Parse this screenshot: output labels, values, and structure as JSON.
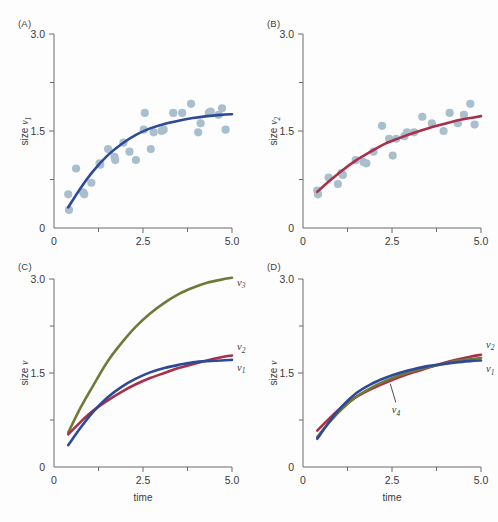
{
  "figure": {
    "background": "#fdfdfd",
    "panels": [
      "A",
      "B",
      "C",
      "D"
    ]
  },
  "colors": {
    "curve_v1": "#2d4a98",
    "curve_v2": "#a8304a",
    "curve_v3": "#6f7a38",
    "curve_v4": "#6f7a38",
    "scatter": "#a9bfcd",
    "axis": "#6b6b6b",
    "text": "#3a3a3a"
  },
  "axes": {
    "x_label": "time",
    "x_ticks": [
      "0",
      "2.5",
      "5.0"
    ],
    "x_tick_values": [
      0,
      2.5,
      5.0
    ],
    "x_minor_values": [
      1.25,
      3.75
    ],
    "x_min": 0,
    "x_max": 5.0,
    "y_ticks": [
      "0",
      "1.5",
      "3.0"
    ],
    "y_tick_values": [
      0,
      1.5,
      3.0
    ],
    "y_minor_values": [
      0.75,
      2.25
    ],
    "y_min": 0,
    "y_max": 3.0
  },
  "panel_A": {
    "label": "(A)",
    "y_label_prefix": "size ",
    "y_label_symbol": "ν",
    "y_label_sub": "1",
    "show_x_title": false
  },
  "panel_B": {
    "label": "(B)",
    "y_label_prefix": "size ",
    "y_label_symbol": "ν",
    "y_label_sub": "2",
    "show_x_title": false
  },
  "panel_C": {
    "label": "(C)",
    "y_label_prefix": "size ",
    "y_label_symbol": "ν",
    "y_label_sub": "",
    "show_x_title": true,
    "curve_labels": [
      {
        "symbol": "ν",
        "sub": "3"
      },
      {
        "symbol": "ν",
        "sub": "2"
      },
      {
        "symbol": "ν",
        "sub": "1"
      }
    ]
  },
  "panel_D": {
    "label": "(D)",
    "y_label_prefix": "size ",
    "y_label_symbol": "ν",
    "y_label_sub": "",
    "show_x_title": true,
    "curve_labels": [
      {
        "symbol": "ν",
        "sub": "2"
      },
      {
        "symbol": "ν",
        "sub": "1"
      },
      {
        "symbol": "ν",
        "sub": "4"
      }
    ]
  },
  "chart_data": [
    {
      "type": "scatter",
      "panel": "A",
      "title": "(A)",
      "xlabel": "time",
      "ylabel": "size ν1",
      "xlim": [
        0,
        5.0
      ],
      "ylim": [
        0,
        3.0
      ],
      "grid": false,
      "legend": "none",
      "series": [
        {
          "name": "data points",
          "kind": "scatter",
          "color": "#a9bfcd",
          "x": [
            0.4,
            0.42,
            0.62,
            0.82,
            0.85,
            1.05,
            1.28,
            1.3,
            1.52,
            1.7,
            1.72,
            1.95,
            2.12,
            2.3,
            2.52,
            2.55,
            2.72,
            2.8,
            3.02,
            3.08,
            3.35,
            3.6,
            3.85,
            4.05,
            4.12,
            4.35,
            4.4,
            4.62,
            4.72,
            4.82
          ],
          "y": [
            0.52,
            0.28,
            0.92,
            0.55,
            0.52,
            0.7,
            1.0,
            0.98,
            1.22,
            1.1,
            1.05,
            1.32,
            1.18,
            1.05,
            1.52,
            1.78,
            1.22,
            1.48,
            1.5,
            1.52,
            1.78,
            1.78,
            1.92,
            1.48,
            1.62,
            1.78,
            1.8,
            1.75,
            1.85,
            1.52
          ]
        },
        {
          "name": "ν1 fit",
          "kind": "line",
          "color": "#2d4a98",
          "x": [
            0.4,
            0.75,
            1.1,
            1.5,
            1.9,
            2.3,
            2.7,
            3.1,
            3.5,
            3.9,
            4.3,
            4.7,
            5.0
          ],
          "y": [
            0.32,
            0.62,
            0.88,
            1.12,
            1.3,
            1.44,
            1.54,
            1.61,
            1.66,
            1.7,
            1.73,
            1.75,
            1.76
          ]
        }
      ]
    },
    {
      "type": "scatter",
      "panel": "B",
      "title": "(B)",
      "xlabel": "time",
      "ylabel": "size ν2",
      "xlim": [
        0,
        5.0
      ],
      "ylim": [
        0,
        3.0
      ],
      "grid": false,
      "legend": "none",
      "series": [
        {
          "name": "data points",
          "kind": "scatter",
          "color": "#a9bfcd",
          "x": [
            0.4,
            0.42,
            0.72,
            0.98,
            1.08,
            1.12,
            1.48,
            1.7,
            1.78,
            1.98,
            2.22,
            2.42,
            2.52,
            2.62,
            2.85,
            2.92,
            3.12,
            3.35,
            3.62,
            3.95,
            4.12,
            4.35,
            4.52,
            4.7,
            4.82
          ],
          "y": [
            0.58,
            0.52,
            0.78,
            0.68,
            0.85,
            0.82,
            1.05,
            1.02,
            1.0,
            1.18,
            1.58,
            1.38,
            1.12,
            1.38,
            1.42,
            1.48,
            1.48,
            1.72,
            1.62,
            1.5,
            1.78,
            1.62,
            1.75,
            1.92,
            1.6
          ]
        },
        {
          "name": "ν2 fit",
          "kind": "line",
          "color": "#a8304a",
          "x": [
            0.4,
            0.75,
            1.1,
            1.5,
            1.9,
            2.3,
            2.7,
            3.1,
            3.5,
            3.9,
            4.3,
            4.7,
            5.0
          ],
          "y": [
            0.56,
            0.73,
            0.89,
            1.05,
            1.18,
            1.3,
            1.39,
            1.47,
            1.54,
            1.6,
            1.66,
            1.7,
            1.73
          ]
        }
      ]
    },
    {
      "type": "line",
      "panel": "C",
      "title": "(C)",
      "xlabel": "time",
      "ylabel": "size ν",
      "xlim": [
        0,
        5.0
      ],
      "ylim": [
        0,
        3.0
      ],
      "grid": false,
      "legend": "inline-right",
      "series": [
        {
          "name": "ν3",
          "kind": "line",
          "color": "#6f7a38",
          "x": [
            0.4,
            0.75,
            1.1,
            1.5,
            1.9,
            2.3,
            2.7,
            3.1,
            3.5,
            3.9,
            4.3,
            4.7,
            5.0
          ],
          "y": [
            0.55,
            0.95,
            1.3,
            1.68,
            1.98,
            2.24,
            2.45,
            2.62,
            2.76,
            2.86,
            2.94,
            2.99,
            3.02
          ]
        },
        {
          "name": "ν2",
          "kind": "line",
          "color": "#a8304a",
          "x": [
            0.4,
            0.75,
            1.1,
            1.5,
            1.9,
            2.3,
            2.7,
            3.1,
            3.5,
            3.9,
            4.3,
            4.7,
            5.0
          ],
          "y": [
            0.52,
            0.72,
            0.9,
            1.06,
            1.2,
            1.32,
            1.42,
            1.5,
            1.58,
            1.64,
            1.7,
            1.75,
            1.78
          ]
        },
        {
          "name": "ν1",
          "kind": "line",
          "color": "#2d4a98",
          "x": [
            0.4,
            0.75,
            1.1,
            1.5,
            1.9,
            2.3,
            2.7,
            3.1,
            3.5,
            3.9,
            4.3,
            4.7,
            5.0
          ],
          "y": [
            0.35,
            0.63,
            0.88,
            1.11,
            1.28,
            1.41,
            1.51,
            1.58,
            1.63,
            1.67,
            1.69,
            1.7,
            1.71
          ]
        }
      ]
    },
    {
      "type": "line",
      "panel": "D",
      "title": "(D)",
      "xlabel": "time",
      "ylabel": "size ν",
      "xlim": [
        0,
        5.0
      ],
      "ylim": [
        0,
        3.0
      ],
      "grid": false,
      "legend": "inline-right",
      "annotations": [
        {
          "text": "ν4",
          "x": 2.55,
          "y": 0.92,
          "leader_to_x": 2.45,
          "leader_to_y": 1.33
        }
      ],
      "series": [
        {
          "name": "ν2",
          "kind": "line",
          "color": "#a8304a",
          "x": [
            0.4,
            0.75,
            1.1,
            1.5,
            1.9,
            2.3,
            2.7,
            3.1,
            3.5,
            3.9,
            4.3,
            4.7,
            5.0
          ],
          "y": [
            0.58,
            0.78,
            0.96,
            1.12,
            1.24,
            1.34,
            1.43,
            1.51,
            1.58,
            1.65,
            1.71,
            1.76,
            1.79
          ]
        },
        {
          "name": "ν4",
          "kind": "line",
          "color": "#6f7a38",
          "x": [
            0.4,
            0.75,
            1.1,
            1.5,
            1.9,
            2.3,
            2.7,
            3.1,
            3.5,
            3.9,
            4.3,
            4.7,
            5.0
          ],
          "y": [
            0.48,
            0.72,
            0.93,
            1.12,
            1.26,
            1.37,
            1.46,
            1.53,
            1.59,
            1.64,
            1.69,
            1.72,
            1.74
          ]
        },
        {
          "name": "ν1",
          "kind": "line",
          "color": "#2d4a98",
          "x": [
            0.4,
            0.75,
            1.1,
            1.5,
            1.9,
            2.3,
            2.7,
            3.1,
            3.5,
            3.9,
            4.3,
            4.7,
            5.0
          ],
          "y": [
            0.45,
            0.73,
            0.97,
            1.18,
            1.32,
            1.42,
            1.5,
            1.56,
            1.61,
            1.64,
            1.67,
            1.69,
            1.7
          ]
        }
      ]
    }
  ]
}
